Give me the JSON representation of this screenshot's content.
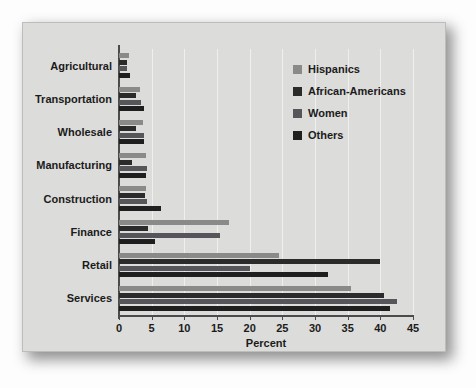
{
  "chart_data": {
    "type": "bar",
    "orientation": "horizontal",
    "title": "",
    "xlabel": "Percent",
    "ylabel": "",
    "xlim": [
      0,
      45
    ],
    "xticks": [
      0,
      5,
      10,
      15,
      20,
      25,
      30,
      35,
      40,
      45
    ],
    "grid": true,
    "legend_position": "top-right",
    "categories": [
      "Agricultural",
      "Transportation",
      "Wholesale",
      "Manufacturing",
      "Construction",
      "Finance",
      "Retail",
      "Services"
    ],
    "series": [
      {
        "name": "Hispanics",
        "color": "#8a8a88",
        "values": [
          1.6,
          3.2,
          3.6,
          4.2,
          4.2,
          16.8,
          24.5,
          35.5
        ]
      },
      {
        "name": "African-Americans",
        "color": "#2b2b2b",
        "values": [
          1.2,
          2.6,
          2.6,
          2.0,
          4.0,
          4.4,
          40.0,
          40.5
        ]
      },
      {
        "name": "Women",
        "color": "#55555a",
        "values": [
          1.3,
          3.4,
          3.8,
          4.3,
          4.3,
          15.4,
          20.0,
          42.5
        ]
      },
      {
        "name": "Others",
        "color": "#1f1f1f",
        "values": [
          1.7,
          3.8,
          3.8,
          4.2,
          6.4,
          5.5,
          32.0,
          41.5
        ]
      }
    ]
  },
  "legend": {
    "items": [
      {
        "label": "Hispanics"
      },
      {
        "label": "African-Americans"
      },
      {
        "label": "Women"
      },
      {
        "label": "Others"
      }
    ]
  },
  "axis": {
    "x_title": "Percent"
  },
  "colors": {
    "panel": "#dcdcda",
    "axis": "#4b4b4b",
    "grid": "#efefee",
    "text": "#1b1b1b"
  }
}
